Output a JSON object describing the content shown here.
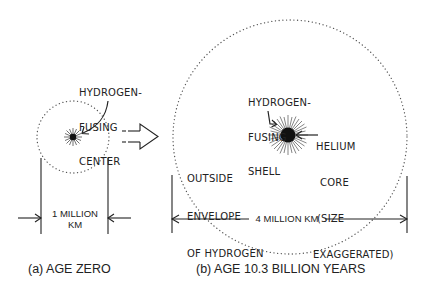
{
  "panel_a": {
    "caption": "(a) AGE ZERO",
    "center_label": [
      "HYDROGEN-",
      "FUSING",
      "CENTER"
    ],
    "dimension": [
      "1 MILLION",
      "KM"
    ]
  },
  "panel_b": {
    "caption": "(b) AGE 10.3 BILLION YEARS",
    "shell_label": [
      "HYDROGEN-",
      "FUSING",
      "SHELL"
    ],
    "core_label": [
      "HELIUM",
      "CORE",
      "(SIZE",
      "EXAGGERATED)"
    ],
    "envelope_label": [
      "OUTSIDE",
      "ENVELOPE",
      "OF HYDROGEN"
    ],
    "dimension": "4 MILLION KM"
  },
  "colors": {
    "ink": "#222222",
    "dots": "#555555",
    "background": "#ffffff"
  }
}
